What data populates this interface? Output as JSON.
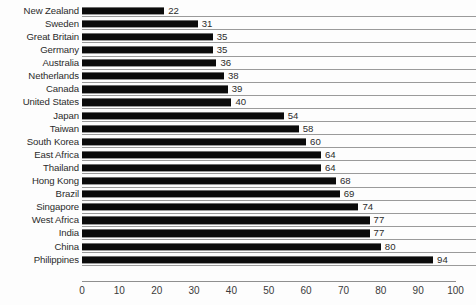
{
  "chart_data": {
    "type": "bar",
    "orientation": "horizontal",
    "title": "",
    "xlabel": "",
    "ylabel": "",
    "xlim": [
      0,
      100
    ],
    "xticks": [
      0,
      10,
      20,
      30,
      40,
      50,
      60,
      70,
      80,
      90,
      100
    ],
    "grid": true,
    "legend": null,
    "bar_color": "#0b0b0b",
    "grid_color": "#9a9a9a",
    "text_color": "#2b2b2b",
    "background": "#fdfdfd",
    "show_value_labels": true,
    "categories": [
      "New Zealand",
      "Sweden",
      "Great Britain",
      "Germany",
      "Australia",
      "Netherlands",
      "Canada",
      "United States",
      "Japan",
      "Taiwan",
      "South Korea",
      "East Africa",
      "Thailand",
      "Hong Kong",
      "Brazil",
      "Singapore",
      "West Africa",
      "India",
      "China",
      "Philippines"
    ],
    "values": [
      22,
      31,
      35,
      35,
      36,
      38,
      39,
      40,
      54,
      58,
      60,
      64,
      64,
      68,
      69,
      74,
      77,
      77,
      80,
      94
    ]
  }
}
